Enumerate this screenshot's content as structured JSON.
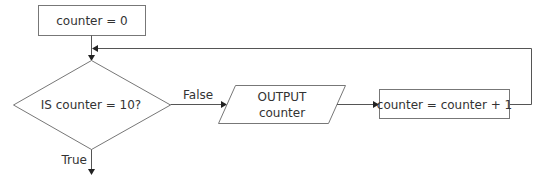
{
  "diagram": {
    "type": "flowchart",
    "nodes": [
      {
        "id": "init",
        "shape": "process",
        "text": "counter = 0"
      },
      {
        "id": "decision",
        "shape": "decision",
        "text": "IS counter = 10?"
      },
      {
        "id": "output",
        "shape": "io",
        "line1": "OUTPUT",
        "line2": "counter"
      },
      {
        "id": "increment",
        "shape": "process",
        "text": "counter = counter + 1"
      }
    ],
    "edges": [
      {
        "from": "init",
        "to": "decision",
        "label": ""
      },
      {
        "from": "decision",
        "to": "output",
        "label": "False"
      },
      {
        "from": "output",
        "to": "increment",
        "label": ""
      },
      {
        "from": "increment",
        "to": "decision",
        "label": "",
        "note": "loop back"
      },
      {
        "from": "decision",
        "to": "exit",
        "label": "True"
      }
    ],
    "labels": {
      "false": "False",
      "true": "True"
    },
    "colors": {
      "stroke": "#777777",
      "text": "#333333",
      "background": "#ffffff"
    }
  }
}
